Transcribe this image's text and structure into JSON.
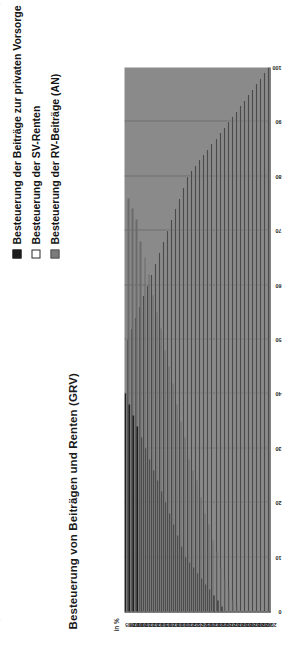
{
  "chart_data": {
    "type": "bar",
    "orientation": "vertical",
    "title": "Besteuerung von Beiträgen und Renten (GRV)",
    "xlabel": "",
    "ylabel": "in %",
    "unit": "in %",
    "ylim": [
      0,
      100
    ],
    "yticks": [
      "100",
      "90",
      "80",
      "70",
      "60",
      "50",
      "40",
      "30",
      "20",
      "10",
      "0"
    ],
    "grid": true,
    "legend_position": "top-right",
    "legend": [
      {
        "label": "Besteuerung der Beiträge zur privaten Vorsorge",
        "color": "#1f1f1f",
        "marker": "filled-square"
      },
      {
        "label": "Besteuerung der SV-Renten",
        "color": "#fbfbfb",
        "marker": "empty-square"
      },
      {
        "label": "Besteuerung der RV-Beiträge (AN)",
        "color": "#6a6a6a",
        "marker": "gray-square"
      }
    ],
    "categories": [
      "2005",
      "2006",
      "2007",
      "2008",
      "2009",
      "2010",
      "2011",
      "2012",
      "2013",
      "2014",
      "2015",
      "2016",
      "2017",
      "2018",
      "2019",
      "2020",
      "2021",
      "2022",
      "2023",
      "2024",
      "2025",
      "2026",
      "2027",
      "2028",
      "2029",
      "2030",
      "2031",
      "2032",
      "2033",
      "2034",
      "2035",
      "2036",
      "2037",
      "2038",
      "2039",
      "2040"
    ],
    "series": [
      {
        "name": "Besteuerung der Beiträge zur privaten Vorsorge",
        "color": "#1f1f1f",
        "values": [
          40,
          38,
          36,
          34,
          32,
          30,
          28,
          26,
          24,
          22,
          20,
          18,
          16,
          14,
          12,
          10,
          9,
          8,
          7,
          6,
          5,
          4,
          3,
          2,
          1,
          0,
          0,
          0,
          0,
          0,
          0,
          0,
          0,
          0,
          0,
          0
        ]
      },
      {
        "name": "Besteuerung der SV-Renten",
        "color": "#fbfbfb",
        "values": [
          50,
          52,
          54,
          56,
          58,
          60,
          62,
          64,
          66,
          68,
          70,
          72,
          74,
          76,
          78,
          80,
          81,
          82,
          83,
          84,
          85,
          86,
          87,
          88,
          89,
          90,
          91,
          92,
          93,
          94,
          95,
          96,
          97,
          98,
          99,
          100
        ]
      },
      {
        "name": "Besteuerung der RV-Beiträge (AN)",
        "color": "#6a6a6a",
        "values": [
          76,
          74,
          72,
          68,
          65,
          62,
          58,
          55,
          52,
          48,
          45,
          42,
          38,
          35,
          32,
          28,
          26,
          24,
          21,
          18,
          16,
          13,
          11,
          8,
          6,
          4,
          2,
          1,
          0,
          0,
          0,
          0,
          0,
          0,
          0,
          0
        ]
      }
    ]
  }
}
